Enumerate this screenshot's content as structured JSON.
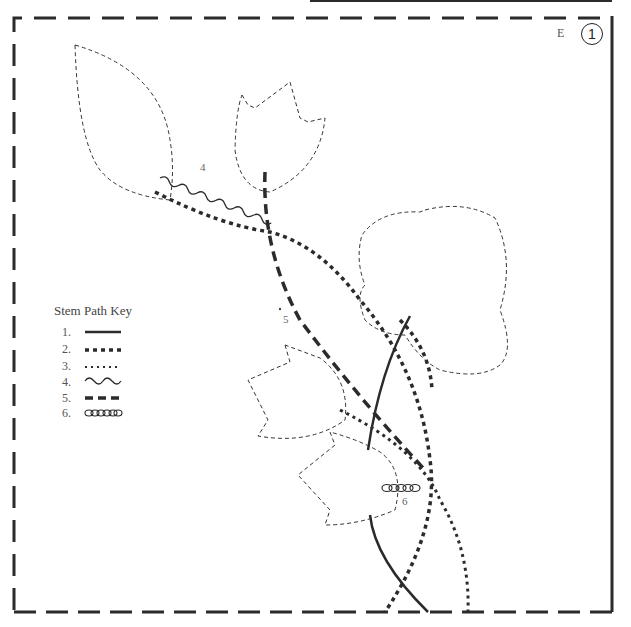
{
  "page": {
    "section_letter": "E",
    "block_number": "1"
  },
  "key": {
    "title": "Stem Path Key",
    "items": [
      {
        "num": "1.",
        "style": "solid"
      },
      {
        "num": "2.",
        "style": "heavy-dotted"
      },
      {
        "num": "3.",
        "style": "fine-dotted"
      },
      {
        "num": "4.",
        "style": "wavy"
      },
      {
        "num": "5.",
        "style": "long-dashed"
      },
      {
        "num": "6.",
        "style": "chain-stitch"
      }
    ]
  },
  "path_labels": {
    "wavy": "4",
    "dashed": "5",
    "chain": "6"
  },
  "colors": {
    "stroke": "#2b2b2b",
    "outline": "#333333",
    "background": "#ffffff"
  }
}
